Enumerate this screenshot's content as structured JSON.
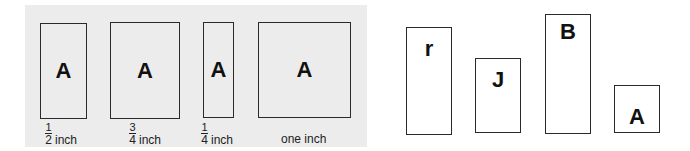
{
  "left_panel": {
    "background": "#ececec",
    "boxes": [
      {
        "letter": "A",
        "numerator": "1",
        "denominator": "2",
        "unit": "inch",
        "label_text": "1/2 inch"
      },
      {
        "letter": "A",
        "numerator": "3",
        "denominator": "4",
        "unit": "inch",
        "label_text": "3/4 inch"
      },
      {
        "letter": "A",
        "numerator": "1",
        "denominator": "4",
        "unit": "inch",
        "label_text": "1/4 inch"
      },
      {
        "letter": "A",
        "label_text": "one inch"
      }
    ]
  },
  "right_panel": {
    "boxes": [
      {
        "letter": "r"
      },
      {
        "letter": "J"
      },
      {
        "letter": "B"
      },
      {
        "letter": "A"
      }
    ]
  }
}
